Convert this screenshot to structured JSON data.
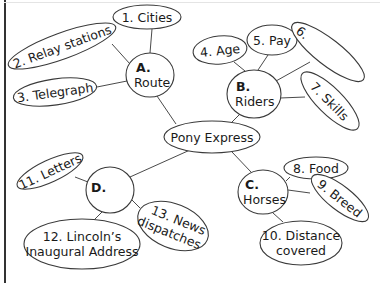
{
  "diagram": {
    "type": "concept-web",
    "center": {
      "label": "Pony Express"
    },
    "branches": [
      {
        "letter": "A.",
        "label": "Route",
        "items": [
          {
            "label": "1. Cities"
          },
          {
            "label": "2. Relay stations"
          },
          {
            "label": "3. Telegraph"
          }
        ]
      },
      {
        "letter": "B.",
        "label": "Riders",
        "items": [
          {
            "label": "4. Age"
          },
          {
            "label": "5. Pay"
          },
          {
            "label": "6."
          },
          {
            "label": "7. Skills"
          }
        ]
      },
      {
        "letter": "C.",
        "label": "Horses",
        "items": [
          {
            "label": "8. Food"
          },
          {
            "label": "9. Breed"
          },
          {
            "label": "10. Distance",
            "label2": "covered"
          }
        ]
      },
      {
        "letter": "D.",
        "label": "",
        "items": [
          {
            "label": "11. Letters"
          },
          {
            "label": "12. Lincoln’s",
            "label2": "Inaugural Address"
          },
          {
            "label": "13. News",
            "label2": "dispatches"
          }
        ]
      }
    ]
  },
  "colors": {
    "stroke": "#3a3a3a",
    "text": "#1a1a1a",
    "background": "#ffffff"
  }
}
